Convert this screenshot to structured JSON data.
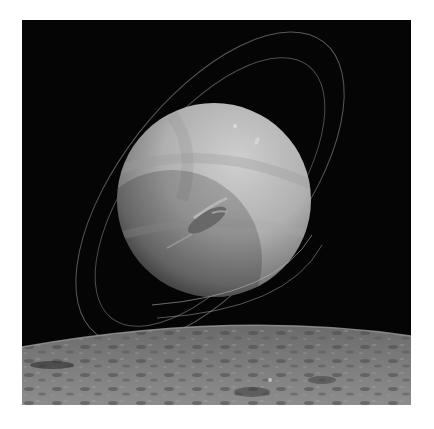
{
  "image": {
    "subject": "Neptune with rings above a cratered moon horizon",
    "alt": "Grayscale view of the ringed planet Neptune rising over the cratered surface of a moon",
    "colors": {
      "background_page": "#ffffff",
      "space": "#050505",
      "planet_light": "#c9c9c9",
      "planet_mid": "#9a9a9a",
      "planet_dark": "#3a3a3a",
      "ring": "#8a8a8a",
      "surface_light": "#8c8c8c",
      "surface_dark": "#3f3f3f"
    },
    "objects": [
      {
        "name": "planet",
        "center": [
          192,
          180
        ],
        "radius": 97
      },
      {
        "name": "outer-ring"
      },
      {
        "name": "inner-ring"
      },
      {
        "name": "great-dark-spot"
      },
      {
        "name": "moon-surface"
      }
    ]
  }
}
